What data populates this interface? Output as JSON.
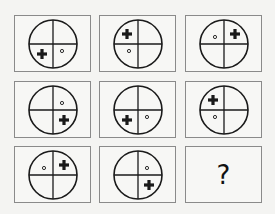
{
  "puzzle": {
    "grid_rows": 3,
    "grid_cols": 3,
    "cells": [
      {
        "row": 0,
        "col": 0,
        "plus_quadrant": "bottom-left",
        "dot_quadrant": "bottom-right"
      },
      {
        "row": 0,
        "col": 1,
        "plus_quadrant": "top-left",
        "dot_quadrant": "bottom-left"
      },
      {
        "row": 0,
        "col": 2,
        "plus_quadrant": "top-right",
        "dot_quadrant": "top-left"
      },
      {
        "row": 1,
        "col": 0,
        "plus_quadrant": "bottom-right",
        "dot_quadrant": "top-right"
      },
      {
        "row": 1,
        "col": 1,
        "plus_quadrant": "bottom-left",
        "dot_quadrant": "bottom-right"
      },
      {
        "row": 1,
        "col": 2,
        "plus_quadrant": "top-left",
        "dot_quadrant": "bottom-left"
      },
      {
        "row": 2,
        "col": 0,
        "plus_quadrant": "top-right",
        "dot_quadrant": "top-left"
      },
      {
        "row": 2,
        "col": 1,
        "plus_quadrant": "bottom-right",
        "dot_quadrant": "top-right"
      },
      {
        "row": 2,
        "col": 2,
        "unknown": true,
        "label": "?"
      }
    ],
    "colors": {
      "stroke": "#1a1a1a",
      "border": "#8a8a8a",
      "background": "#f4f4f2"
    }
  }
}
